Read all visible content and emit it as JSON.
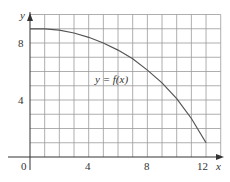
{
  "chart_data": {
    "type": "line",
    "title": "",
    "xlabel": "x",
    "ylabel": "y",
    "xlim": [
      0,
      13
    ],
    "ylim": [
      0,
      10
    ],
    "x_ticks": [
      "0",
      "4",
      "8",
      "12"
    ],
    "y_ticks": [
      "4",
      "8"
    ],
    "grid": true,
    "grid_step": 1,
    "annotation": "y = f(x)",
    "series": [
      {
        "name": "f(x)",
        "x": [
          0,
          1,
          2,
          3,
          4,
          5,
          6,
          7,
          8,
          9,
          10,
          11,
          12
        ],
        "y": [
          9,
          9,
          8.9,
          8.7,
          8.4,
          8.0,
          7.5,
          6.9,
          6.1,
          5.2,
          4.1,
          2.7,
          1.0
        ]
      }
    ]
  },
  "labels": {
    "x_axis": "x",
    "y_axis": "y",
    "tick_0": "0",
    "tick_x4": "4",
    "tick_x8": "8",
    "tick_x12": "12",
    "tick_y4": "4",
    "tick_y8": "8",
    "curve_label": "y = f(x)"
  },
  "colors": {
    "grid": "#9a9a9a",
    "axis": "#333333",
    "curve": "#555555"
  }
}
